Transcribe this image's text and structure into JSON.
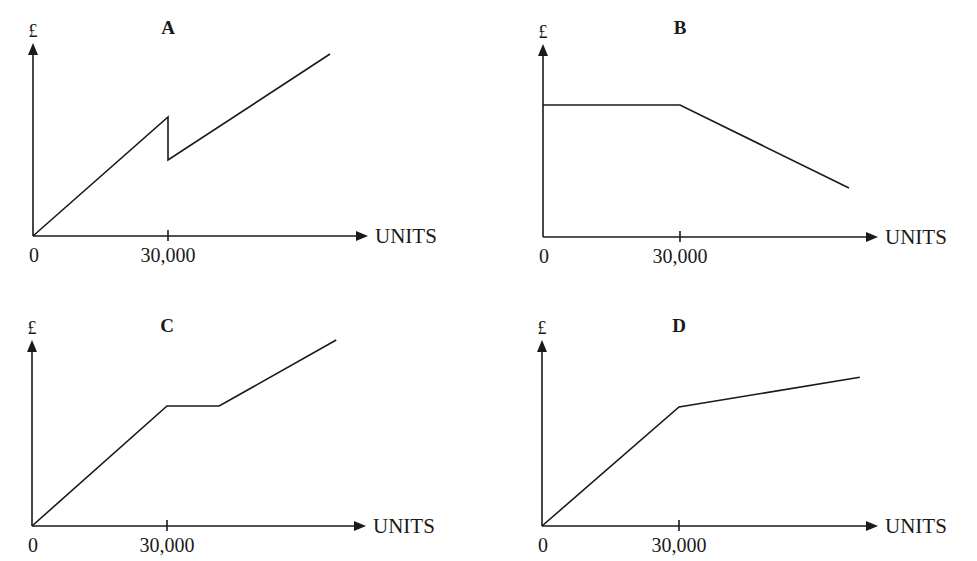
{
  "chart_data": [
    {
      "type": "line",
      "title": "A",
      "xlabel": "UNITS",
      "ylabel": "£",
      "x_ticks": [
        {
          "value": 0,
          "label": "0"
        },
        {
          "value": 30000,
          "label": "30,000"
        }
      ],
      "xlim": [
        0,
        74000
      ],
      "ylim": [
        0,
        100
      ],
      "series": [
        {
          "name": "A",
          "points": [
            [
              0,
              0
            ],
            [
              30000,
              61.7
            ],
            [
              30000,
              39.4
            ],
            [
              66000,
              94.3
            ]
          ]
        }
      ]
    },
    {
      "type": "line",
      "title": "B",
      "xlabel": "UNITS",
      "ylabel": "£",
      "x_ticks": [
        {
          "value": 0,
          "label": "0"
        },
        {
          "value": 30000,
          "label": "30,000"
        }
      ],
      "xlim": [
        0,
        73000
      ],
      "ylim": [
        0,
        100
      ],
      "series": [
        {
          "name": "B",
          "points": [
            [
              0,
              68.4
            ],
            [
              30000,
              68.4
            ],
            [
              67000,
              25.4
            ]
          ]
        }
      ]
    },
    {
      "type": "line",
      "title": "C",
      "xlabel": "UNITS",
      "ylabel": "£",
      "x_ticks": [
        {
          "value": 0,
          "label": "0"
        },
        {
          "value": 30000,
          "label": "30,000"
        }
      ],
      "xlim": [
        0,
        74000
      ],
      "ylim": [
        0,
        100
      ],
      "series": [
        {
          "name": "C",
          "points": [
            [
              0,
              0
            ],
            [
              30000,
              64.5
            ],
            [
              41600,
              64.5
            ],
            [
              67600,
              100
            ]
          ]
        }
      ]
    },
    {
      "type": "line",
      "title": "D",
      "xlabel": "UNITS",
      "ylabel": "£",
      "x_ticks": [
        {
          "value": 0,
          "label": "0"
        },
        {
          "value": 30000,
          "label": "30,000"
        }
      ],
      "xlim": [
        0,
        73500
      ],
      "ylim": [
        0,
        100
      ],
      "series": [
        {
          "name": "D",
          "points": [
            [
              0,
              0
            ],
            [
              30000,
              64
            ],
            [
              69600,
              80
            ]
          ]
        }
      ]
    }
  ]
}
